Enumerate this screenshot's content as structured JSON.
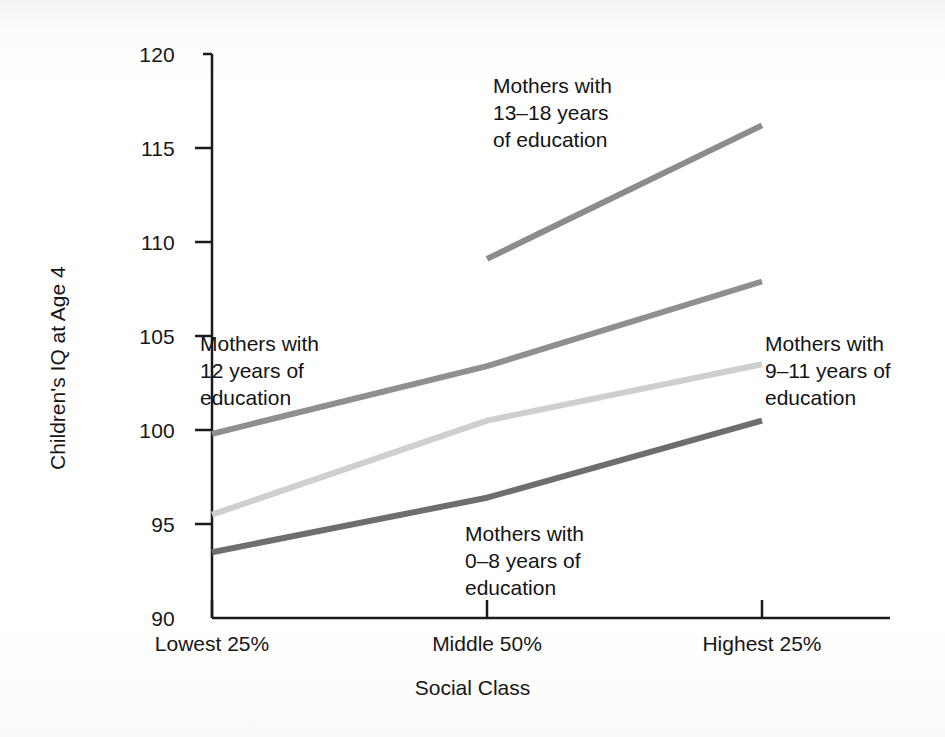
{
  "chart_data": {
    "type": "line",
    "title": "",
    "xlabel": "Social Class",
    "ylabel": "Children's IQ at Age 4",
    "categories": [
      "Lowest 25%",
      "Middle 50%",
      "Highest 25%"
    ],
    "ylim": [
      90,
      120
    ],
    "yticks": [
      90,
      95,
      100,
      105,
      110,
      115,
      120
    ],
    "ytick_labels": [
      "90",
      "95",
      "100",
      "105",
      "110",
      "115",
      "120"
    ],
    "grid": false,
    "legend": "inline-annotations",
    "series": [
      {
        "name": "Mothers with 13–18 years of education",
        "values": [
          null,
          109.1,
          116.2
        ],
        "color": "#8c8c8c",
        "width": 6
      },
      {
        "name": "Mothers with 12 years of education",
        "values": [
          99.8,
          103.4,
          107.9
        ],
        "color": "#8f8f8f",
        "width": 6
      },
      {
        "name": "Mothers with 9–11 years of education",
        "values": [
          95.5,
          100.5,
          103.5
        ],
        "color": "#cfcfcf",
        "width": 6
      },
      {
        "name": "Mothers with 0–8 years of education",
        "values": [
          93.5,
          96.4,
          100.5
        ],
        "color": "#6e6e6e",
        "width": 6
      }
    ],
    "annotations": [
      {
        "id": "ann-13-18",
        "text": "Mothers with\n13–18 years\nof education",
        "x": 493,
        "y": 72
      },
      {
        "id": "ann-12",
        "text": "Mothers with\n12 years of\neducation",
        "x": 200,
        "y": 330
      },
      {
        "id": "ann-9-11",
        "text": "Mothers with\n9–11 years of\neducation",
        "x": 765,
        "y": 330
      },
      {
        "id": "ann-0-8",
        "text": "Mothers with\n0–8 years of\neducation",
        "x": 465,
        "y": 520
      }
    ]
  },
  "axis": {
    "ytick_120": "120",
    "ytick_115": "115",
    "ytick_110": "110",
    "ytick_105": "105",
    "ytick_100": "100",
    "ytick_95": "95",
    "ytick_90": "90",
    "xtick_lowest": "Lowest 25%",
    "xtick_middle": "Middle 50%",
    "xtick_highest": "Highest 25%",
    "ylabel": "Children's IQ at Age 4",
    "xlabel": "Social Class"
  },
  "annotations": {
    "a13_18": "Mothers with\n13–18 years\nof education",
    "a12": "Mothers with\n12 years of\neducation",
    "a9_11": "Mothers with\n9–11 years of\neducation",
    "a0_8": "Mothers with\n0–8 years of\neducation"
  }
}
